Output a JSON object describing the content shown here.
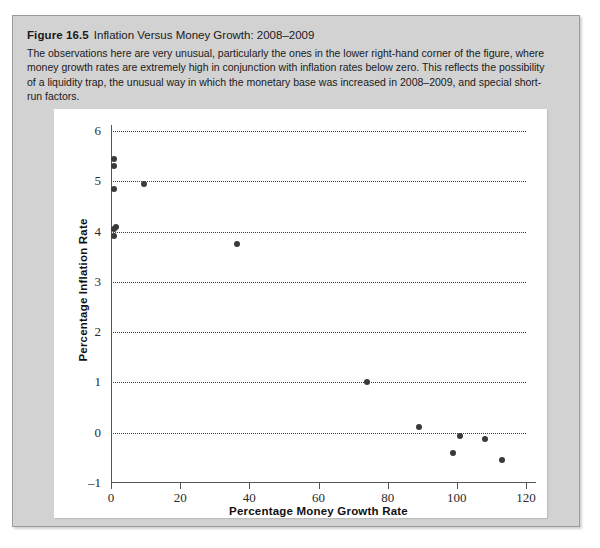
{
  "figure": {
    "number": "Figure 16.5",
    "title": "Inflation Versus Money Growth: 2008–2009",
    "description": "The observations here are very unusual, particularly the ones in the lower right-hand corner of the figure, where money growth rates are extremely high in conjunction with inflation rates below zero. This reflects the possibility of a liquidity trap, the unusual way in which the monetary base was increased in 2008–2009, and special short-run factors."
  },
  "chart_data": {
    "type": "scatter",
    "title": "Inflation Versus Money Growth: 2008–2009",
    "xlabel": "Percentage Money Growth Rate",
    "ylabel": "Percentage Inflation Rate",
    "xlim": [
      0,
      120
    ],
    "ylim": [
      -1,
      6
    ],
    "xticks": [
      0,
      20,
      40,
      60,
      80,
      100,
      120
    ],
    "yticks": [
      -1,
      0,
      1,
      2,
      3,
      4,
      5,
      6
    ],
    "gridlines": {
      "horizontal": [
        0,
        1,
        2,
        3,
        4,
        5,
        6
      ],
      "vertical": []
    },
    "grid": true,
    "legend": null,
    "point_color": "#3a3a3a",
    "points": [
      {
        "x": 1.0,
        "y": 5.45
      },
      {
        "x": 1.0,
        "y": 5.3
      },
      {
        "x": 1.0,
        "y": 4.85
      },
      {
        "x": 9.5,
        "y": 4.95
      },
      {
        "x": 1.5,
        "y": 4.1
      },
      {
        "x": 1.0,
        "y": 4.05
      },
      {
        "x": 1.0,
        "y": 3.92
      },
      {
        "x": 36.5,
        "y": 3.75
      },
      {
        "x": 74.0,
        "y": 1.0
      },
      {
        "x": 89.0,
        "y": 0.12
      },
      {
        "x": 101.0,
        "y": -0.06
      },
      {
        "x": 108.0,
        "y": -0.12
      },
      {
        "x": 99.0,
        "y": -0.4
      },
      {
        "x": 113.0,
        "y": -0.55
      }
    ]
  },
  "colors": {
    "panel_background": "#d2d2d2",
    "plot_background": "#ffffff",
    "axis": "#555555",
    "grid": "#3c3c3c",
    "text": "#1a1a1a"
  }
}
